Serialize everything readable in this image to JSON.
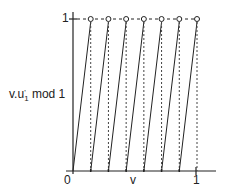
{
  "diagram": {
    "y_axis_label_main": "v.u",
    "y_axis_label_sup": "'",
    "y_axis_label_sub": "1",
    "y_axis_label_tail": " mod 1",
    "y_tick_top": "1",
    "x_origin": "0",
    "x_axis_label": "v",
    "x_tick_end": "1",
    "segments": 7,
    "colors": {
      "line": "#222222",
      "background": "#ffffff"
    }
  }
}
